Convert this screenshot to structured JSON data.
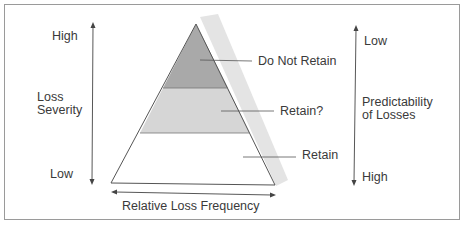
{
  "left_axis": {
    "high": "High",
    "title_line1": "Loss",
    "title_line2": "Severity",
    "low": "Low"
  },
  "right_axis": {
    "low": "Low",
    "title_line1": "Predictability",
    "title_line2": "of Losses",
    "high": "High"
  },
  "bottom_axis": {
    "title": "Relative Loss Frequency"
  },
  "pyramid": {
    "tiers": [
      {
        "label": "Do Not Retain",
        "fill": "#a9a9a9"
      },
      {
        "label": "Retain?",
        "fill": "#d6d6d6"
      },
      {
        "label": "Retain",
        "fill": "#ffffff"
      }
    ],
    "shadow_color": "#e4e4e4",
    "outline_color": "#555555"
  }
}
